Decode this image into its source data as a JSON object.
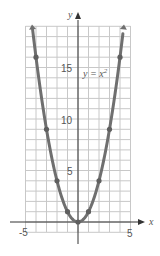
{
  "chart_data": {
    "type": "line",
    "title": "",
    "xlabel": "x",
    "ylabel": "y",
    "annotation": "y = x²",
    "equation": {
      "base": "y = x",
      "exponent": "2"
    },
    "x_ticks": [
      "-5",
      "5"
    ],
    "y_ticks": [
      "5",
      "10",
      "15"
    ],
    "xlim": [
      -5,
      5
    ],
    "ylim": [
      -2,
      19
    ],
    "grid": true,
    "series": [
      {
        "name": "y = x^2",
        "x": [
          -4,
          -3,
          -2,
          -1,
          0,
          1,
          2,
          3,
          4
        ],
        "values": [
          16,
          9,
          4,
          1,
          0,
          1,
          4,
          9,
          16
        ]
      }
    ],
    "colors": {
      "curve": "#6f6f6f",
      "grid": "#c8c8c8",
      "axis": "#333333"
    }
  }
}
